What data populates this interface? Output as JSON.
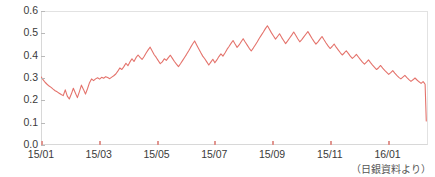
{
  "figure": {
    "clipped_title": "  ",
    "source_note": "（日銀資料より）"
  },
  "chart_data": {
    "type": "line",
    "title": "",
    "subtitle": "",
    "xlabel": "",
    "ylabel": "",
    "ylim": [
      0.0,
      0.6
    ],
    "yticks": [
      "0.0",
      "0.1",
      "0.2",
      "0.3",
      "0.4",
      "0.5",
      "0.6"
    ],
    "ytick_values": [
      0.0,
      0.1,
      0.2,
      0.3,
      0.4,
      0.5,
      0.6
    ],
    "xticks": [
      "15/01",
      "15/03",
      "15/05",
      "15/07",
      "15/09",
      "15/11",
      "16/01"
    ],
    "xtick_positions": [
      0,
      2,
      4,
      6,
      8,
      10,
      12
    ],
    "xlim": [
      0,
      13.4
    ],
    "grid": false,
    "legend": null,
    "series": [
      {
        "name": "rate",
        "color": "#e4736c",
        "linewidth": 1.1,
        "x": [
          0.0,
          0.07,
          0.14,
          0.21,
          0.28,
          0.35,
          0.42,
          0.49,
          0.56,
          0.63,
          0.7,
          0.77,
          0.84,
          0.91,
          0.98,
          1.05,
          1.12,
          1.19,
          1.26,
          1.33,
          1.4,
          1.47,
          1.54,
          1.61,
          1.68,
          1.75,
          1.82,
          1.89,
          1.96,
          2.03,
          2.1,
          2.17,
          2.24,
          2.31,
          2.38,
          2.45,
          2.52,
          2.59,
          2.66,
          2.73,
          2.8,
          2.87,
          2.94,
          3.01,
          3.08,
          3.15,
          3.22,
          3.29,
          3.36,
          3.43,
          3.5,
          3.57,
          3.64,
          3.71,
          3.78,
          3.85,
          3.92,
          3.99,
          4.06,
          4.13,
          4.2,
          4.27,
          4.34,
          4.41,
          4.48,
          4.55,
          4.62,
          4.69,
          4.76,
          4.83,
          4.9,
          4.97,
          5.04,
          5.11,
          5.18,
          5.25,
          5.32,
          5.39,
          5.46,
          5.53,
          5.6,
          5.67,
          5.74,
          5.81,
          5.88,
          5.95,
          6.02,
          6.09,
          6.16,
          6.23,
          6.3,
          6.37,
          6.44,
          6.51,
          6.58,
          6.65,
          6.72,
          6.79,
          6.86,
          6.93,
          7.0,
          7.07,
          7.14,
          7.21,
          7.28,
          7.35,
          7.42,
          7.49,
          7.56,
          7.63,
          7.7,
          7.77,
          7.84,
          7.91,
          7.98,
          8.05,
          8.12,
          8.19,
          8.26,
          8.33,
          8.4,
          8.47,
          8.54,
          8.61,
          8.68,
          8.75,
          8.82,
          8.89,
          8.96,
          9.03,
          9.1,
          9.17,
          9.24,
          9.31,
          9.38,
          9.45,
          9.52,
          9.59,
          9.66,
          9.73,
          9.8,
          9.87,
          9.94,
          10.01,
          10.08,
          10.15,
          10.22,
          10.29,
          10.36,
          10.43,
          10.5,
          10.57,
          10.64,
          10.71,
          10.78,
          10.85,
          10.92,
          10.99,
          11.06,
          11.13,
          11.2,
          11.27,
          11.34,
          11.41,
          11.48,
          11.55,
          11.62,
          11.69,
          11.76,
          11.83,
          11.9,
          11.97,
          12.04,
          12.11,
          12.18,
          12.25,
          12.32,
          12.39,
          12.46,
          12.53,
          12.6,
          12.67,
          12.74,
          12.81,
          12.88,
          12.95,
          13.02,
          13.09,
          13.16,
          13.23,
          13.26,
          13.3,
          13.34
        ],
        "y": [
          0.305,
          0.293,
          0.281,
          0.272,
          0.264,
          0.258,
          0.25,
          0.243,
          0.238,
          0.232,
          0.226,
          0.221,
          0.247,
          0.219,
          0.206,
          0.228,
          0.254,
          0.233,
          0.212,
          0.239,
          0.268,
          0.249,
          0.228,
          0.252,
          0.279,
          0.296,
          0.288,
          0.296,
          0.301,
          0.295,
          0.303,
          0.299,
          0.306,
          0.302,
          0.297,
          0.304,
          0.31,
          0.318,
          0.331,
          0.345,
          0.338,
          0.351,
          0.366,
          0.355,
          0.372,
          0.386,
          0.374,
          0.391,
          0.403,
          0.392,
          0.383,
          0.396,
          0.412,
          0.426,
          0.438,
          0.421,
          0.404,
          0.392,
          0.378,
          0.364,
          0.372,
          0.386,
          0.379,
          0.391,
          0.402,
          0.388,
          0.374,
          0.362,
          0.351,
          0.364,
          0.378,
          0.392,
          0.406,
          0.421,
          0.437,
          0.452,
          0.466,
          0.448,
          0.431,
          0.414,
          0.398,
          0.386,
          0.372,
          0.358,
          0.371,
          0.384,
          0.368,
          0.381,
          0.396,
          0.408,
          0.398,
          0.412,
          0.428,
          0.441,
          0.455,
          0.468,
          0.452,
          0.437,
          0.448,
          0.462,
          0.476,
          0.461,
          0.447,
          0.433,
          0.421,
          0.434,
          0.448,
          0.462,
          0.478,
          0.492,
          0.506,
          0.521,
          0.534,
          0.518,
          0.502,
          0.488,
          0.474,
          0.486,
          0.498,
          0.482,
          0.468,
          0.454,
          0.466,
          0.479,
          0.492,
          0.506,
          0.491,
          0.476,
          0.462,
          0.472,
          0.484,
          0.496,
          0.508,
          0.493,
          0.478,
          0.464,
          0.452,
          0.462,
          0.474,
          0.486,
          0.471,
          0.457,
          0.444,
          0.432,
          0.441,
          0.452,
          0.438,
          0.426,
          0.414,
          0.403,
          0.412,
          0.422,
          0.41,
          0.398,
          0.388,
          0.396,
          0.406,
          0.394,
          0.382,
          0.371,
          0.362,
          0.371,
          0.381,
          0.369,
          0.358,
          0.348,
          0.338,
          0.346,
          0.356,
          0.344,
          0.334,
          0.325,
          0.316,
          0.324,
          0.333,
          0.322,
          0.312,
          0.303,
          0.296,
          0.304,
          0.312,
          0.302,
          0.293,
          0.285,
          0.292,
          0.3,
          0.291,
          0.283,
          0.276,
          0.284,
          0.279,
          0.272,
          0.108
        ]
      }
    ],
    "annotations": [
      {
        "text": "（日銀資料より）",
        "position": "bottom-right"
      }
    ]
  }
}
